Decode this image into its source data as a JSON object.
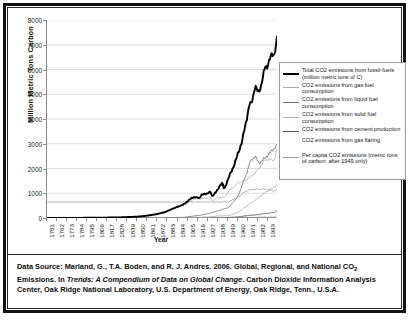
{
  "chart_data": {
    "type": "line",
    "title": "",
    "xlabel": "Year",
    "ylabel": "Million Metric Tons Carbon",
    "ylim": [
      0,
      8000
    ],
    "xlim": [
      1751,
      2003
    ],
    "ytick_labels": [
      "0",
      "1000",
      "2000",
      "3000",
      "4000",
      "5000",
      "6000",
      "7000",
      "8000"
    ],
    "yticks": [
      0,
      1000,
      2000,
      3000,
      4000,
      5000,
      6000,
      7000,
      8000
    ],
    "xtick_labels": [
      "1751",
      "1762",
      "1773",
      "1784",
      "1795",
      "1806",
      "1817",
      "1828",
      "1839",
      "1850",
      "1861",
      "1872",
      "1883",
      "1894",
      "1905",
      "1916",
      "1927",
      "1938",
      "1949",
      "1960",
      "1971",
      "1982",
      "1993"
    ],
    "grid": "horizontal",
    "legend_position": "right",
    "series": [
      {
        "name": "total-co2-fossil-fuels",
        "label": "Total CO2 emissions from fossil-fuels (million metric tons of C)",
        "color": "#000000",
        "width": 1.9,
        "x": [
          1751,
          1800,
          1830,
          1850,
          1860,
          1870,
          1880,
          1890,
          1900,
          1910,
          1913,
          1918,
          1920,
          1925,
          1930,
          1932,
          1935,
          1938,
          1940,
          1943,
          1945,
          1946,
          1950,
          1955,
          1960,
          1965,
          1970,
          1973,
          1975,
          1979,
          1980,
          1982,
          1983,
          1985,
          1987,
          1990,
          1992,
          1995,
          1997,
          2000,
          2002,
          2003
        ],
        "y": [
          3,
          8,
          24,
          54,
          91,
          147,
          236,
          396,
          534,
          819,
          843,
          806,
          932,
          975,
          1053,
          880,
          1007,
          1126,
          1299,
          1429,
          1160,
          1238,
          1630,
          2043,
          2569,
          3137,
          4053,
          4614,
          4614,
          5321,
          5255,
          5112,
          5094,
          5271,
          5574,
          6143,
          6095,
          6400,
          6600,
          6611,
          6972,
          7303
        ]
      },
      {
        "name": "gas-fuel-consumption",
        "label": "CO2 emissions from gas fuel consumption",
        "color": "#a8a8a8",
        "width": 0.8,
        "x": [
          1885,
          1900,
          1920,
          1930,
          1940,
          1950,
          1960,
          1970,
          1980,
          1990,
          2000,
          2003
        ],
        "y": [
          1,
          9,
          26,
          47,
          87,
          97,
          227,
          493,
          740,
          1034,
          1258,
          1323
        ]
      },
      {
        "name": "liquid-fuel-consumption",
        "label": "CO2 emissions from liquid fuel consumption",
        "color": "#6e6e6e",
        "width": 0.8,
        "x": [
          1870,
          1900,
          1920,
          1930,
          1940,
          1950,
          1960,
          1970,
          1973,
          1979,
          1983,
          1990,
          2000,
          2003
        ],
        "y": [
          1,
          24,
          118,
          196,
          310,
          423,
          849,
          1838,
          2238,
          2512,
          2198,
          2420,
          2829,
          2940
        ]
      },
      {
        "name": "solid-fuel-consumption",
        "label": "CO2 emissions from solid fuel consumption",
        "color": "#b4b4b4",
        "width": 0.8,
        "x": [
          1751,
          1800,
          1850,
          1880,
          1900,
          1913,
          1920,
          1925,
          1930,
          1932,
          1938,
          1945,
          1950,
          1960,
          1970,
          1980,
          1990,
          2000,
          2003
        ],
        "y": [
          3,
          8,
          54,
          232,
          501,
          768,
          786,
          802,
          818,
          679,
          835,
          814,
          1070,
          1410,
          1556,
          1846,
          2360,
          2342,
          2777
        ]
      },
      {
        "name": "cement-production",
        "label": "CO2 emissions from cement production",
        "color": "#555555",
        "width": 0.8,
        "x": [
          1928,
          1940,
          1950,
          1960,
          1970,
          1980,
          1990,
          2000,
          2003
        ],
        "y": [
          11,
          13,
          18,
          43,
          95,
          132,
          178,
          226,
          298
        ]
      },
      {
        "name": "gas-flaring",
        "label": "CO2 emissions from gas flaring",
        "color": "#cfcfcf",
        "width": 0.7,
        "x": [
          1950,
          1960,
          1970,
          1980,
          1990,
          2000,
          2003
        ],
        "y": [
          23,
          48,
          87,
          86,
          58,
          58,
          60
        ]
      },
      {
        "name": "per-capita-co2",
        "label": "Per capita CO2 emissions (metric tons of carbon; after 1949 only)",
        "color": "#9b9b9b",
        "width": 0.8,
        "note": "after 1949 only",
        "x": [
          1950,
          1960,
          1970,
          1980,
          1990,
          2000,
          2003
        ],
        "y": [
          646,
          850,
          1105,
          1168,
          1163,
          1093,
          1157
        ]
      }
    ]
  },
  "legend": {
    "items": [
      {
        "label": "Total CO2 emissions from fossil-fuels (million metric tons of C)",
        "color": "#000000",
        "thickness": "2.2px",
        "visible": true
      },
      {
        "label": "CO2 emissions from gas fuel consumption",
        "color": "#a8a8a8",
        "thickness": "1.1px",
        "visible": true
      },
      {
        "label": "CO2 emissions from liquid fuel consumption",
        "color": "#6e6e6e",
        "thickness": "1.1px",
        "visible": true
      },
      {
        "label": "CO2 emissions from solid fuel consumption",
        "color": "#b4b4b4",
        "thickness": "1.1px",
        "visible": true
      },
      {
        "label": "CO2 emissions from cement production",
        "color": "#555555",
        "thickness": "1.1px",
        "visible": true
      },
      {
        "label": "CO2 emissions from gas flaring",
        "color": "#cfcfcf",
        "thickness": "0px",
        "visible": false
      },
      {
        "label": "Per capita CO2 emissions (metric tons of carbon; after 1949 only)",
        "color": "#9b9b9b",
        "thickness": "1.1px",
        "visible": true
      }
    ]
  },
  "caption": {
    "line1_a": "Data Source: Marland, G., T.A. Boden, and R. J. Andres. 2006. Global, Regional, and National CO",
    "line1_sub": "2",
    "line2_a": "Emissions. In ",
    "line2_italic": "Trends: A Compendium of Data on Global Change",
    "line2_b": ". Carbon Dioxide Information Analysis",
    "line3": "Center, Oak Ridge National Laboratory, U.S. Department of Energy, Oak Ridge, Tenn., U.S.A."
  }
}
